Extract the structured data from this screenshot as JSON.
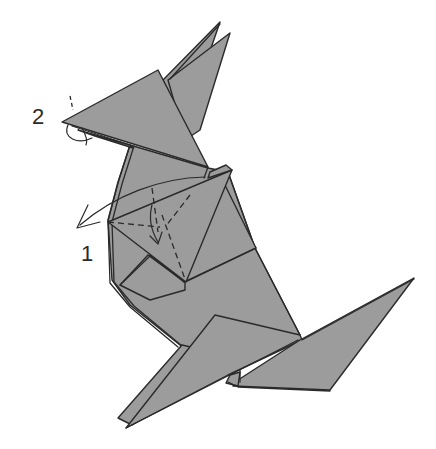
{
  "diagram": {
    "step_labels": [
      {
        "id": "step-1",
        "text": "1"
      },
      {
        "id": "step-2",
        "text": "2"
      }
    ],
    "colors": {
      "paper_fill": "#9c9c9c",
      "line": "#2a2a2a",
      "background": "#ffffff"
    },
    "symbols": [
      {
        "type": "valley-fold-line",
        "near": "step-1"
      },
      {
        "type": "fold-arrow",
        "near": "step-1"
      },
      {
        "type": "fold-arrow-curved",
        "near": "step-1"
      },
      {
        "type": "inside-reverse-fold-arrow",
        "near": "step-2"
      }
    ]
  }
}
